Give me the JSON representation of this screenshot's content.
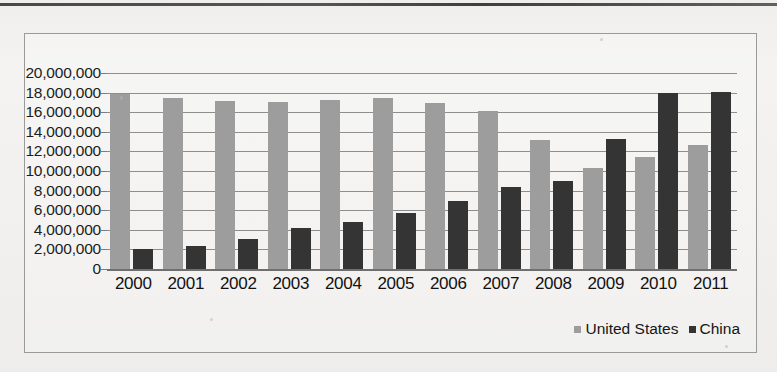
{
  "chart_data": {
    "type": "bar",
    "title": "",
    "xlabel": "",
    "ylabel": "",
    "categories": [
      "2000",
      "2001",
      "2002",
      "2003",
      "2004",
      "2005",
      "2006",
      "2007",
      "2008",
      "2009",
      "2010",
      "2011"
    ],
    "series": [
      {
        "name": "United States",
        "color": "#9d9d9d",
        "values": [
          17900000,
          17500000,
          17100000,
          17000000,
          17200000,
          17400000,
          16950000,
          16100000,
          13200000,
          10300000,
          11400000,
          12700000
        ]
      },
      {
        "name": "China",
        "color": "#343434",
        "values": [
          2000000,
          2300000,
          3100000,
          4200000,
          4800000,
          5700000,
          6900000,
          8400000,
          9000000,
          13300000,
          18000000,
          18100000
        ]
      }
    ],
    "ylim": [
      0,
      20000000
    ],
    "ytick_values": [
      0,
      2000000,
      4000000,
      6000000,
      8000000,
      10000000,
      12000000,
      14000000,
      16000000,
      18000000,
      20000000
    ],
    "ytick_labels": [
      "0",
      "2,000,000",
      "4,000,000",
      "6,000,000",
      "8,000,000",
      "10,000,000",
      "12,000,000",
      "14,000,000",
      "16,000,000",
      "18,000,000",
      "20,000,000"
    ],
    "grid": true,
    "legend_position": "bottom-right"
  },
  "legend": {
    "items": [
      {
        "label": "United States",
        "color": "#9d9d9d"
      },
      {
        "label": "China",
        "color": "#343434"
      }
    ]
  }
}
